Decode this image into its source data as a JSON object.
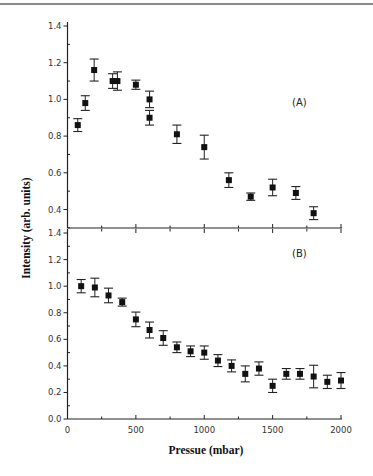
{
  "chart_data": [
    {
      "type": "scatter",
      "panel_label": "(A)",
      "xlabel": "Pressue (mbar)",
      "ylabel": "Intensity (arb. units)",
      "xlim": [
        0,
        2000
      ],
      "ylim": [
        0.3,
        1.4
      ],
      "yticks": [
        0.4,
        0.6,
        0.8,
        1.0,
        1.2,
        1.4
      ],
      "ytick_labels": [
        "0.4",
        "0.6",
        "0.8",
        "1.0",
        "1.2",
        "1.4"
      ],
      "grid": false,
      "series": [
        {
          "name": "A",
          "marker": "square",
          "x": [
            75,
            130,
            195,
            330,
            365,
            500,
            600,
            600,
            800,
            1000,
            1180,
            1340,
            1500,
            1670,
            1800
          ],
          "y": [
            0.86,
            0.98,
            1.16,
            1.1,
            1.1,
            1.08,
            1.0,
            0.9,
            0.81,
            0.74,
            0.56,
            0.47,
            0.52,
            0.49,
            0.38
          ],
          "err": [
            0.035,
            0.04,
            0.06,
            0.04,
            0.05,
            0.025,
            0.045,
            0.04,
            0.05,
            0.065,
            0.04,
            0.02,
            0.045,
            0.035,
            0.035
          ]
        }
      ]
    },
    {
      "type": "scatter",
      "panel_label": "(B)",
      "xlabel": "Pressue (mbar)",
      "ylabel": "Intensity (arb. units)",
      "xlim": [
        0,
        2000
      ],
      "ylim": [
        0.0,
        1.4
      ],
      "xticks": [
        0,
        500,
        1000,
        1500,
        2000
      ],
      "xtick_labels": [
        "0",
        "500",
        "1000",
        "1500",
        "2000"
      ],
      "yticks": [
        0.0,
        0.2,
        0.4,
        0.6,
        0.8,
        1.0,
        1.2,
        1.4
      ],
      "ytick_labels": [
        "0.0",
        "0.2",
        "0.4",
        "0.6",
        "0.8",
        "1.0",
        "1.2",
        "1.4"
      ],
      "grid": false,
      "series": [
        {
          "name": "B",
          "marker": "square",
          "x": [
            100,
            200,
            300,
            400,
            500,
            600,
            700,
            800,
            900,
            1000,
            1100,
            1200,
            1300,
            1400,
            1500,
            1600,
            1700,
            1800,
            1900,
            2000
          ],
          "y": [
            1.0,
            0.99,
            0.93,
            0.88,
            0.75,
            0.67,
            0.61,
            0.54,
            0.51,
            0.5,
            0.44,
            0.4,
            0.34,
            0.38,
            0.25,
            0.34,
            0.34,
            0.32,
            0.28,
            0.29
          ],
          "err": [
            0.05,
            0.07,
            0.055,
            0.03,
            0.055,
            0.06,
            0.055,
            0.04,
            0.04,
            0.05,
            0.045,
            0.045,
            0.06,
            0.05,
            0.05,
            0.04,
            0.04,
            0.085,
            0.05,
            0.06
          ]
        }
      ]
    }
  ],
  "labels": {
    "panel_a": "(A)",
    "panel_b": "(B)",
    "xlabel": "Pressue (mbar)",
    "ylabel": "Intensity (arb. units)"
  }
}
